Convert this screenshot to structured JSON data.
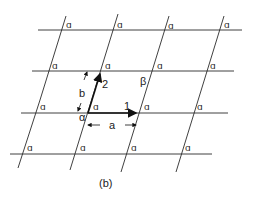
{
  "diagram": {
    "caption": "(b)",
    "labels": {
      "vector1": "1",
      "vector2": "2",
      "length_a": "a",
      "length_b": "b",
      "origin_angle": "α",
      "angle_beta": "β"
    },
    "motif_glyph": "ɑ",
    "rows": [
      {
        "y": 30,
        "x1": 38,
        "x2": 242,
        "crossings": [
          61,
          113,
          164,
          219
        ]
      },
      {
        "y": 71,
        "x1": 32,
        "x2": 234,
        "crossings": [
          48,
          101,
          153,
          206
        ]
      },
      {
        "y": 113,
        "x1": 21,
        "x2": 228,
        "crossings": [
          34,
          88,
          139,
          192
        ]
      },
      {
        "y": 154,
        "x1": 10,
        "x2": 212,
        "crossings": [
          22,
          75,
          127,
          181
        ]
      }
    ],
    "colors": {
      "line": "#2a2a2a",
      "background": "#ffffff"
    }
  }
}
